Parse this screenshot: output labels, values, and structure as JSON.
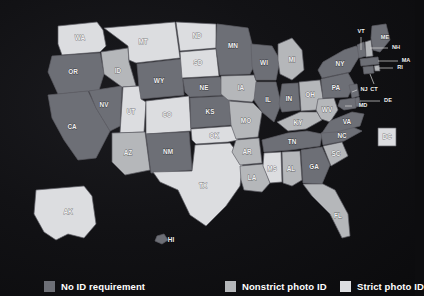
{
  "figure": {
    "background_color": "#101013",
    "border_color": "#5f5f66"
  },
  "legend": {
    "position": "bottom",
    "items": [
      {
        "label": "No ID requirement",
        "color": "#6d6f76",
        "left_px": 44
      },
      {
        "label": "Nonstrict photo ID",
        "color": "#b5b7ba",
        "left_px": 225
      },
      {
        "label": "Strict photo ID",
        "color": "#dcdde0",
        "left_px": 340
      }
    ]
  },
  "chart_data": {
    "type": "map",
    "title": "",
    "subtitle": "",
    "xlabel": "",
    "ylabel": "",
    "projection": "albers-usa",
    "categories": [
      "No ID requirement",
      "Nonstrict photo ID",
      "Strict photo ID"
    ],
    "category_colors": {
      "No ID requirement": "#6d6f76",
      "Nonstrict photo ID": "#b5b7ba",
      "Strict photo ID": "#dcdde0"
    },
    "counts": {
      "No ID requirement": 26,
      "Nonstrict photo ID": 15,
      "Strict photo ID": 10
    },
    "states": [
      {
        "code": "WA",
        "category": "Strict photo ID"
      },
      {
        "code": "OR",
        "category": "No ID requirement"
      },
      {
        "code": "CA",
        "category": "No ID requirement"
      },
      {
        "code": "NV",
        "category": "No ID requirement"
      },
      {
        "code": "ID",
        "category": "Nonstrict photo ID"
      },
      {
        "code": "MT",
        "category": "Strict photo ID"
      },
      {
        "code": "WY",
        "category": "No ID requirement"
      },
      {
        "code": "UT",
        "category": "Strict photo ID"
      },
      {
        "code": "AZ",
        "category": "Nonstrict photo ID"
      },
      {
        "code": "CO",
        "category": "Strict photo ID"
      },
      {
        "code": "NM",
        "category": "No ID requirement"
      },
      {
        "code": "ND",
        "category": "Strict photo ID"
      },
      {
        "code": "SD",
        "category": "Strict photo ID"
      },
      {
        "code": "NE",
        "category": "No ID requirement"
      },
      {
        "code": "KS",
        "category": "No ID requirement"
      },
      {
        "code": "OK",
        "category": "Strict photo ID"
      },
      {
        "code": "TX",
        "category": "Strict photo ID"
      },
      {
        "code": "MN",
        "category": "No ID requirement"
      },
      {
        "code": "IA",
        "category": "Nonstrict photo ID"
      },
      {
        "code": "MO",
        "category": "Nonstrict photo ID"
      },
      {
        "code": "AR",
        "category": "Nonstrict photo ID"
      },
      {
        "code": "LA",
        "category": "Nonstrict photo ID"
      },
      {
        "code": "WI",
        "category": "No ID requirement"
      },
      {
        "code": "IL",
        "category": "No ID requirement"
      },
      {
        "code": "MI",
        "category": "Nonstrict photo ID"
      },
      {
        "code": "IN",
        "category": "No ID requirement"
      },
      {
        "code": "OH",
        "category": "Nonstrict photo ID"
      },
      {
        "code": "KY",
        "category": "Nonstrict photo ID"
      },
      {
        "code": "WV",
        "category": "Nonstrict photo ID"
      },
      {
        "code": "TN",
        "category": "No ID requirement"
      },
      {
        "code": "MS",
        "category": "Strict photo ID"
      },
      {
        "code": "AL",
        "category": "Nonstrict photo ID"
      },
      {
        "code": "GA",
        "category": "No ID requirement"
      },
      {
        "code": "FL",
        "category": "Nonstrict photo ID"
      },
      {
        "code": "SC",
        "category": "Nonstrict photo ID"
      },
      {
        "code": "NC",
        "category": "No ID requirement"
      },
      {
        "code": "VA",
        "category": "No ID requirement"
      },
      {
        "code": "PA",
        "category": "No ID requirement"
      },
      {
        "code": "NY",
        "category": "No ID requirement"
      },
      {
        "code": "VT",
        "category": "No ID requirement"
      },
      {
        "code": "NH",
        "category": "Nonstrict photo ID"
      },
      {
        "code": "ME",
        "category": "No ID requirement"
      },
      {
        "code": "MA",
        "category": "No ID requirement"
      },
      {
        "code": "RI",
        "category": "Nonstrict photo ID"
      },
      {
        "code": "CT",
        "category": "No ID requirement"
      },
      {
        "code": "NJ",
        "category": "No ID requirement"
      },
      {
        "code": "DE",
        "category": "No ID requirement"
      },
      {
        "code": "MD",
        "category": "No ID requirement"
      },
      {
        "code": "DC",
        "category": "Strict photo ID"
      },
      {
        "code": "AK",
        "category": "Strict photo ID"
      },
      {
        "code": "HI",
        "category": "No ID requirement"
      }
    ]
  },
  "labels": {
    "WA": "WA",
    "OR": "OR",
    "CA": "CA",
    "NV": "NV",
    "ID": "ID",
    "MT": "MT",
    "WY": "WY",
    "UT": "UT",
    "AZ": "AZ",
    "CO": "CO",
    "NM": "NM",
    "ND": "ND",
    "SD": "SD",
    "NE": "NE",
    "KS": "KS",
    "OK": "OK",
    "TX": "TX",
    "MN": "MN",
    "IA": "IA",
    "MO": "MO",
    "AR": "AR",
    "LA": "LA",
    "WI": "WI",
    "IL": "IL",
    "MI": "MI",
    "IN": "IN",
    "OH": "OH",
    "KY": "KY",
    "WV": "WV",
    "TN": "TN",
    "MS": "MS",
    "AL": "AL",
    "GA": "GA",
    "FL": "FL",
    "SC": "SC",
    "NC": "NC",
    "VA": "VA",
    "PA": "PA",
    "NY": "NY",
    "VT": "VT",
    "NH": "NH",
    "ME": "ME",
    "MA": "MA",
    "RI": "RI",
    "CT": "CT",
    "NJ": "NJ",
    "DE": "DE",
    "MD": "MD",
    "DC": "DC",
    "AK": "AK",
    "HI": "HI"
  }
}
